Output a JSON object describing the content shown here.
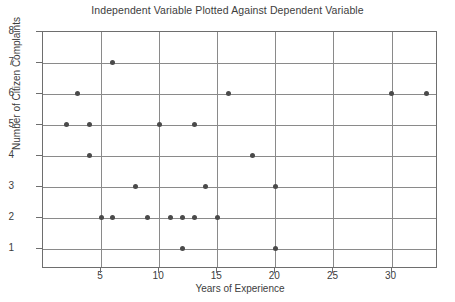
{
  "chart_data": {
    "type": "scatter",
    "title": "Independent Variable Plotted Against Dependent Variable",
    "xlabel": "Years of Experience",
    "ylabel": "Number of Citizen Complaints",
    "xlim": [
      0,
      34
    ],
    "ylim": [
      0.35,
      8
    ],
    "xticks": [
      5,
      10,
      15,
      20,
      25,
      30
    ],
    "xtick_labels": [
      "5",
      "10",
      "15",
      "20",
      "25",
      "30"
    ],
    "yticks": [
      1,
      2,
      3,
      4,
      5,
      6,
      7,
      8
    ],
    "ytick_labels": [
      "1",
      "2",
      "3",
      "4",
      "5",
      "6",
      "7",
      "8"
    ],
    "grid": "both",
    "legend": "none",
    "marker_color": "#4a4a4a",
    "grid_color": "#8a8a8a",
    "frame_color": "#6e6e6e",
    "points": [
      {
        "x": 2,
        "y": 5
      },
      {
        "x": 3,
        "y": 6
      },
      {
        "x": 4,
        "y": 5
      },
      {
        "x": 4,
        "y": 4
      },
      {
        "x": 5,
        "y": 2
      },
      {
        "x": 6,
        "y": 7
      },
      {
        "x": 6,
        "y": 2
      },
      {
        "x": 8,
        "y": 3
      },
      {
        "x": 9,
        "y": 2
      },
      {
        "x": 10,
        "y": 5
      },
      {
        "x": 11,
        "y": 2
      },
      {
        "x": 12,
        "y": 2
      },
      {
        "x": 12,
        "y": 1
      },
      {
        "x": 13,
        "y": 5
      },
      {
        "x": 13,
        "y": 2
      },
      {
        "x": 14,
        "y": 3
      },
      {
        "x": 15,
        "y": 2
      },
      {
        "x": 16,
        "y": 6
      },
      {
        "x": 18,
        "y": 4
      },
      {
        "x": 20,
        "y": 3
      },
      {
        "x": 20,
        "y": 1
      },
      {
        "x": 30,
        "y": 6
      },
      {
        "x": 33,
        "y": 6
      }
    ],
    "n_points": 23
  }
}
